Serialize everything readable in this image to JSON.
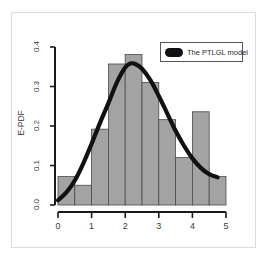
{
  "chart_data": {
    "type": "bar",
    "title": "",
    "subtitle": "",
    "xlabel": "",
    "ylabel": "E-PDF",
    "xlim": [
      0,
      5
    ],
    "ylim": [
      0.0,
      0.4
    ],
    "grid": false,
    "legend_position": "top-right",
    "x_tick_labels": [
      "0",
      "1",
      "2",
      "3",
      "4",
      "5"
    ],
    "x_tick_values": [
      0,
      1,
      2,
      3,
      4,
      5
    ],
    "y_tick_labels": [
      "0.0",
      "0.1",
      "0.2",
      "0.3",
      "0.4"
    ],
    "y_tick_values": [
      0.0,
      0.1,
      0.2,
      0.3,
      0.4
    ],
    "bin_edges": [
      0.0,
      0.5,
      1.0,
      1.5,
      2.0,
      2.5,
      3.0,
      3.5,
      4.0,
      4.5,
      5.0
    ],
    "categories": [
      "0.0-0.5",
      "0.5-1.0",
      "1.0-1.5",
      "1.5-2.0",
      "2.0-2.5",
      "2.5-3.0",
      "3.0-3.5",
      "3.5-4.0",
      "4.0-4.5",
      "4.5-5.0"
    ],
    "values": [
      0.072,
      0.05,
      0.192,
      0.357,
      0.381,
      0.31,
      0.216,
      0.12,
      0.236,
      0.072
    ],
    "bar_color": "#a3a3a3",
    "bar_edge_color": "#4a4a4a",
    "series": [
      {
        "name": "The PTLGL model",
        "type": "line",
        "color": "#111111",
        "x": [
          0.0,
          0.25,
          0.5,
          0.75,
          1.0,
          1.25,
          1.5,
          1.75,
          2.0,
          2.15,
          2.3,
          2.5,
          2.75,
          3.0,
          3.25,
          3.5,
          3.75,
          4.0,
          4.25,
          4.5,
          4.75
        ],
        "y": [
          0.012,
          0.032,
          0.062,
          0.105,
          0.155,
          0.208,
          0.258,
          0.31,
          0.348,
          0.358,
          0.357,
          0.345,
          0.316,
          0.276,
          0.232,
          0.188,
          0.15,
          0.118,
          0.094,
          0.078,
          0.07
        ]
      }
    ]
  },
  "legend": {
    "entries": [
      {
        "label": "The PTLGL model",
        "swatch_color": "#111111",
        "swatch_shape": "rounded-bar"
      }
    ]
  },
  "axes": {
    "y_title": "E-PDF",
    "y_ticks": [
      "0.0",
      "0.1",
      "0.2",
      "0.3",
      "0.4"
    ],
    "x_ticks": [
      "0",
      "1",
      "2",
      "3",
      "4",
      "5"
    ]
  }
}
